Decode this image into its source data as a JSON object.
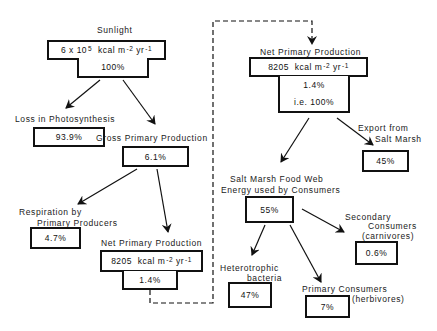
{
  "diagram": {
    "sunlight": {
      "label": "Sunlight",
      "value_base": "6 x 10",
      "value_exp": "5",
      "unit_a": "kcal m",
      "unit_exp_a": "-2",
      "unit_b": "yr",
      "unit_exp_b": "-1",
      "percent": "100%"
    },
    "loss_photosynthesis": {
      "label": "Loss in Photosynthesis",
      "percent": "93.9%"
    },
    "gross_primary_production": {
      "label": "Gross Primary Production",
      "percent": "6.1%"
    },
    "respiration": {
      "label_line1": "Respiration by",
      "label_line2": "Primary Producers",
      "percent": "4.7%"
    },
    "net_primary_production_left": {
      "label": "Net Primary Production",
      "value": "8205",
      "unit_a": "kcal m",
      "unit_exp_a": "-2",
      "unit_b": "yr",
      "unit_exp_b": "-1",
      "percent": "1.4%"
    },
    "net_primary_production_right": {
      "label": "Net Primary Production",
      "value": "8205",
      "unit_a": "kcal m",
      "unit_exp_a": "-2",
      "unit_b": "yr",
      "unit_exp_b": "-1",
      "percent": "1.4%",
      "percent_note": "i.e. 100%"
    },
    "export": {
      "label_line1": "Export from",
      "label_line2": "Salt Marsh",
      "percent": "45%"
    },
    "food_web": {
      "label_line1": "Salt Marsh Food Web",
      "label_line2": "Energy used by Consumers",
      "percent": "55%"
    },
    "secondary_consumers": {
      "label_line1": "Secondary",
      "label_line2": "Consumers",
      "label_line3": "(carnivores)",
      "percent": "0.6%"
    },
    "heterotrophic_bacteria": {
      "label_line1": "Heterotrophic",
      "label_line2": "bacteria",
      "percent": "47%"
    },
    "primary_consumers": {
      "label_line1": "Primary Consumers",
      "label_line2": "(herbivores)",
      "percent": "7%"
    }
  }
}
